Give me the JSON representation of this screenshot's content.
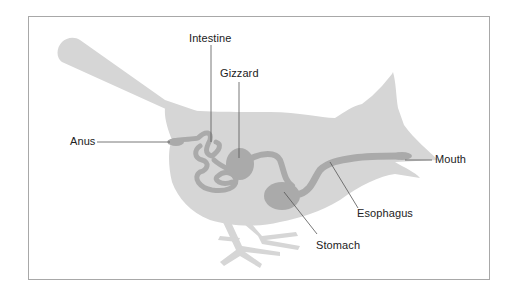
{
  "diagram": {
    "colors": {
      "body": "#d4d4d4",
      "organs": "#a9a9a9",
      "leader_lines": "#555555",
      "frame": "#a8a8a8",
      "text": "#222222"
    },
    "labels": {
      "intestine": "Intestine",
      "gizzard": "Gizzard",
      "anus": "Anus",
      "mouth": "Mouth",
      "esophagus": "Esophagus",
      "stomach": "Stomach"
    }
  }
}
